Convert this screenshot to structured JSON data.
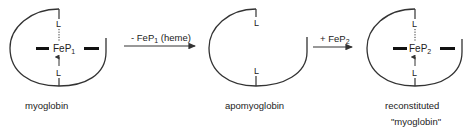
{
  "diagram": {
    "type": "reaction-scheme",
    "colors": {
      "line": "#333333",
      "text": "#222222",
      "background": "#ffffff"
    },
    "species": [
      {
        "id": "myoglobin",
        "label": "myoglobin",
        "ligand_top": "L",
        "ligand_bottom": "L",
        "cofactor": "FeP",
        "cofactor_sub": "1",
        "has_heme": true
      },
      {
        "id": "apomyoglobin",
        "label": "apomyoglobin",
        "ligand_top": "L",
        "ligand_bottom": "L",
        "has_heme": false
      },
      {
        "id": "reconstituted",
        "label": "reconstituted",
        "label_line2": "\"myoglobin\"",
        "ligand_top": "L",
        "ligand_bottom": "L",
        "cofactor": "FeP",
        "cofactor_sub": "2",
        "has_heme": true
      }
    ],
    "arrows": [
      {
        "from": "myoglobin",
        "to": "apomyoglobin",
        "prefix": "- FeP",
        "sub": "1",
        "suffix": " (heme)"
      },
      {
        "from": "apomyoglobin",
        "to": "reconstituted",
        "prefix": "+ FeP",
        "sub": "2",
        "suffix": ""
      }
    ]
  }
}
